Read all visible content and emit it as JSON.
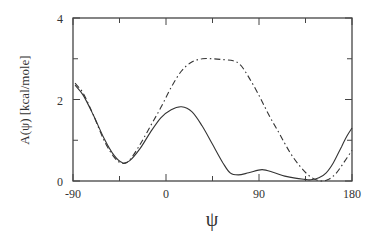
{
  "chart_data": {
    "type": "line",
    "title": "",
    "xlabel": "ψ",
    "ylabel": "A(ψ)   [kcal/mole]",
    "xlim": [
      -90,
      180
    ],
    "ylim": [
      0,
      4
    ],
    "xticks": [
      -90,
      0,
      90,
      180
    ],
    "yticks": [
      0,
      2,
      4
    ],
    "x_minor_ticks": [
      -45,
      45,
      135
    ],
    "y_minor_ticks": [
      1,
      3
    ],
    "grid": false,
    "legend": null,
    "series": [
      {
        "name": "solid",
        "style": "solid",
        "x": [
          -88,
          -80,
          -70,
          -60,
          -50,
          -42,
          -35,
          -25,
          -15,
          -5,
          5,
          15,
          25,
          35,
          45,
          55,
          62,
          70,
          80,
          93,
          105,
          115,
          125,
          135,
          140,
          148,
          155,
          162,
          170,
          175,
          180
        ],
        "y": [
          2.35,
          2.1,
          1.6,
          1.05,
          0.62,
          0.45,
          0.5,
          0.8,
          1.2,
          1.55,
          1.75,
          1.82,
          1.7,
          1.35,
          0.9,
          0.45,
          0.2,
          0.15,
          0.2,
          0.28,
          0.2,
          0.12,
          0.07,
          0.04,
          0.03,
          0.08,
          0.2,
          0.45,
          0.85,
          1.1,
          1.3
        ]
      },
      {
        "name": "dash-dot",
        "style": "dashdot",
        "x": [
          -88,
          -80,
          -70,
          -60,
          -50,
          -42,
          -35,
          -25,
          -15,
          -5,
          5,
          15,
          25,
          35,
          45,
          55,
          65,
          72,
          80,
          90,
          100,
          110,
          120,
          130,
          140,
          150,
          158,
          165,
          172,
          180
        ],
        "y": [
          2.4,
          2.15,
          1.6,
          1.0,
          0.58,
          0.43,
          0.52,
          0.9,
          1.35,
          1.8,
          2.3,
          2.7,
          2.92,
          3.0,
          3.0,
          2.98,
          2.95,
          2.85,
          2.55,
          2.1,
          1.6,
          1.15,
          0.7,
          0.35,
          0.1,
          0.0,
          0.05,
          0.2,
          0.45,
          0.75
        ]
      }
    ]
  }
}
